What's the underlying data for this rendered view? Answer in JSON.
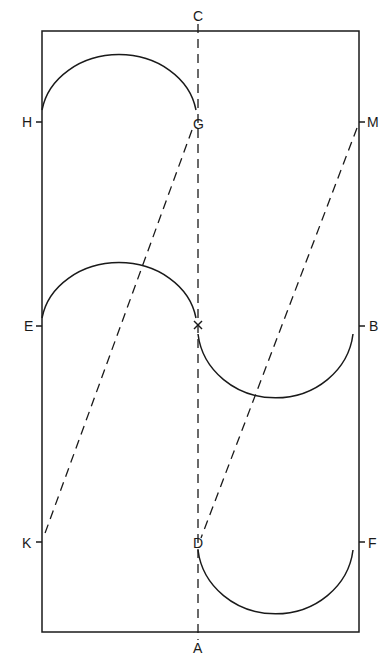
{
  "labels": {
    "C": "C",
    "A": "A",
    "H": "H",
    "G": "G",
    "M": "M",
    "E": "E",
    "X": "X",
    "B": "B",
    "K": "K",
    "D": "D",
    "F": "F"
  },
  "style": {
    "stroke": "#1a1a1a",
    "background": "#ffffff"
  }
}
